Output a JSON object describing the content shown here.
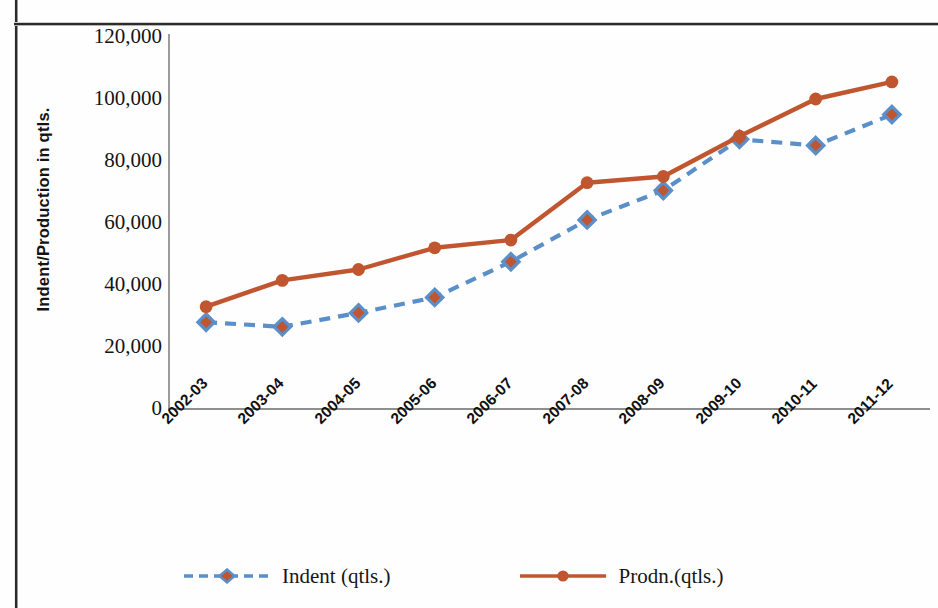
{
  "chart_data": {
    "type": "line",
    "title": "",
    "xlabel": "",
    "ylabel": "Indent/Production in qtls.",
    "categories": [
      "2002-03",
      "2003-04",
      "2004-05",
      "2005-06",
      "2006-07",
      "2007-08",
      "2008-09",
      "2009-10",
      "2010-11",
      "2011-12"
    ],
    "ylim": [
      0,
      120000
    ],
    "ytick_labels": [
      "120,000",
      "100,000",
      "80,000",
      "60,000",
      "40,000",
      "20,000",
      "0"
    ],
    "ytick_values": [
      120000,
      100000,
      80000,
      60000,
      40000,
      20000,
      0
    ],
    "grid": false,
    "legend_position": "bottom",
    "series": [
      {
        "name": "Indent (qtls.)",
        "color": "#5b8fc9",
        "marker": "diamond",
        "marker_color": "#c0562f",
        "line_style": "dashed",
        "values": [
          28000,
          26500,
          31000,
          36000,
          47500,
          61000,
          70500,
          87000,
          85000,
          95000
        ]
      },
      {
        "name": "Prodn.(qtls.)",
        "color": "#c0562f",
        "marker": "circle",
        "marker_color": "#c0562f",
        "line_style": "solid",
        "values": [
          33000,
          41500,
          45000,
          52000,
          54500,
          73000,
          75000,
          88000,
          100000,
          105500
        ]
      }
    ]
  },
  "legend": {
    "items": [
      {
        "label": "Indent (qtls.)"
      },
      {
        "label": "Prodn.(qtls.)"
      }
    ]
  },
  "axes": {
    "y_title": "Indent/Production in qtls."
  }
}
